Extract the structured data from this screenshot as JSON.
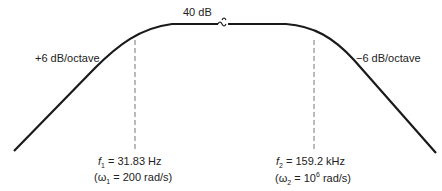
{
  "diagram": {
    "type": "bode-magnitude-asymptotic",
    "plateau_label": "40 dB",
    "left_slope_label": "+6 dB/octave",
    "right_slope_label": "−6 dB/octave",
    "f1": {
      "symbol": "f",
      "sub": "1",
      "value": " = 31.83 Hz",
      "omega_open": "(ω",
      "omega_sub": "1",
      "omega_value": " = 200 rad/s)"
    },
    "f2": {
      "symbol": "f",
      "sub": "2",
      "value": " = 159.2 kHz",
      "omega_open": "(ω",
      "omega_sub": "2",
      "omega_value": " = 10",
      "omega_exp": "6",
      "omega_unit": " rad/s)"
    },
    "colors": {
      "curve": "#1a1a1a",
      "dashed": "#777777",
      "text": "#222222"
    }
  }
}
